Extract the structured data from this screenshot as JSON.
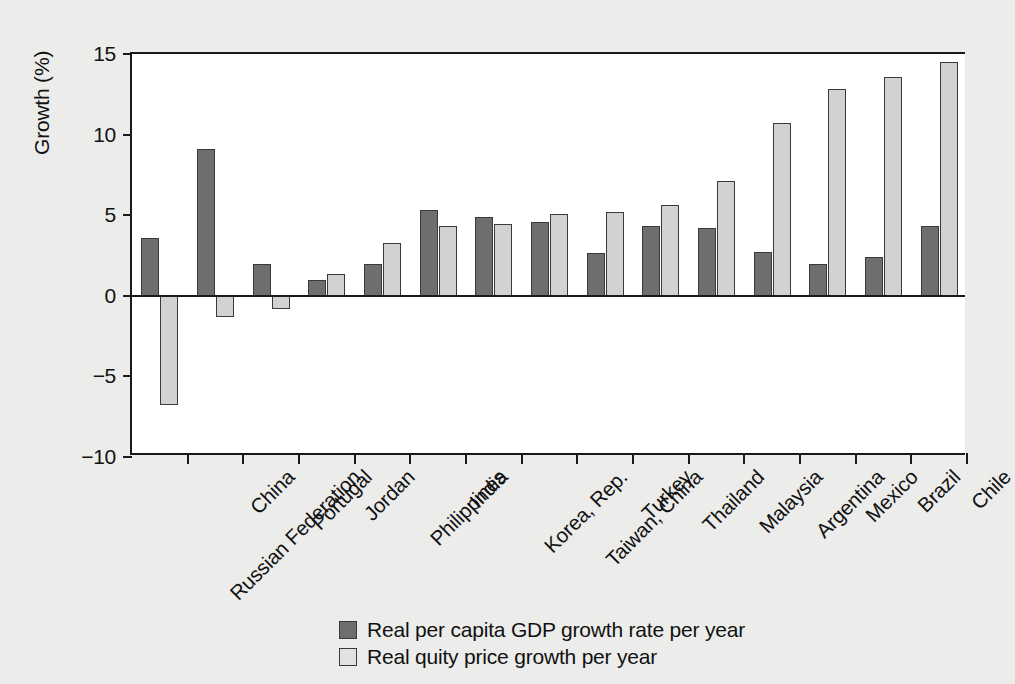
{
  "chart_data": {
    "type": "bar",
    "title": "",
    "xlabel": "",
    "ylabel": "Growth (%)",
    "ylim": [
      -10,
      15
    ],
    "yticks": [
      15,
      10,
      5,
      0,
      -5,
      -10
    ],
    "ytick_labels": [
      "15",
      "10",
      "5",
      "0",
      "−5",
      "−10"
    ],
    "grid": false,
    "legend_position": "bottom-center",
    "categories": [
      "Russian Federation",
      "China",
      "Portugal",
      "Jordan",
      "Philippines",
      "India",
      "Korea, Rep.",
      "Taiwan, China",
      "Turkey",
      "Thailand",
      "Malaysia",
      "Argentina",
      "Mexico",
      "Brazil",
      "Chile"
    ],
    "series": [
      {
        "name": "Real per capita GDP growth rate per year",
        "color": "#6e6e6e",
        "values": [
          3.6,
          9.1,
          2.0,
          1.0,
          1.95,
          5.3,
          4.9,
          4.6,
          2.65,
          4.35,
          4.2,
          2.7,
          1.95,
          2.4,
          4.35
        ]
      },
      {
        "name": "Real quity price growth per year",
        "color": "#d2d2d2",
        "values": [
          -6.8,
          -1.3,
          -0.8,
          1.35,
          3.3,
          4.3,
          4.45,
          5.1,
          5.2,
          5.65,
          7.1,
          10.7,
          12.8,
          13.6,
          14.5
        ]
      }
    ]
  },
  "legend": {
    "items": [
      {
        "label": "Real per capita GDP growth rate per year",
        "swatch": "dark"
      },
      {
        "label": "Real quity price growth per year",
        "swatch": "light"
      }
    ]
  },
  "colors": {
    "series_dark": "#6e6e6e",
    "series_light": "#d2d2d2",
    "axis": "#1a1a1a",
    "plot_background": "#ffffff",
    "page_background": "#ececeb"
  }
}
